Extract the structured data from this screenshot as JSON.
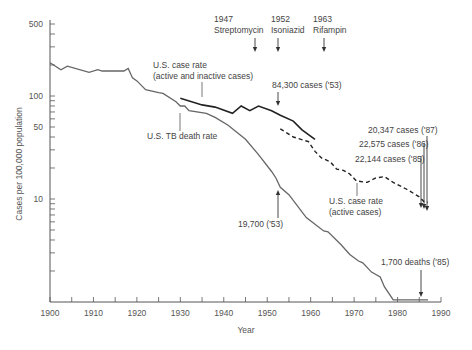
{
  "chart_data": {
    "type": "line",
    "title": "",
    "xlabel": "Year",
    "ylabel": "Cases per 100,000 population",
    "yscale": "log",
    "xlim": [
      1900,
      1990
    ],
    "ylim": [
      1,
      500
    ],
    "x_ticks": [
      "1900",
      "1910",
      "1920",
      "1930",
      "1940",
      "1950",
      "1960",
      "1970",
      "1980",
      "1990"
    ],
    "y_ticks": [
      "500",
      "100",
      "50",
      "10"
    ],
    "grid": false,
    "legend": "none (inline annotations)",
    "series": [
      {
        "name": "U.S. TB death rate",
        "style": "solid-gray",
        "x": [
          1900,
          1902.5,
          1904,
          1909,
          1911,
          1912,
          1917,
          1918,
          1919,
          1920,
          1922,
          1925,
          1926,
          1929,
          1930,
          1931,
          1932,
          1936,
          1938,
          1941,
          1945,
          1948,
          1951,
          1952,
          1953,
          1955,
          1959,
          1963,
          1964,
          1967,
          1969,
          1971,
          1972,
          1974,
          1976,
          1977,
          1979,
          1980,
          1985,
          1987
        ],
        "values": [
          210,
          180,
          195,
          170,
          180,
          175,
          175,
          185,
          150,
          140,
          115,
          108,
          106,
          88,
          80,
          80,
          72,
          68,
          62,
          52,
          38,
          27,
          18.5,
          16,
          13,
          11,
          6.6,
          4.9,
          4.8,
          3.6,
          2.9,
          2.5,
          2.4,
          1.95,
          1.75,
          1.4,
          1.05,
          1.05,
          1.05,
          1.05
        ]
      },
      {
        "name": "U.S. case rate (active and inactive cases)",
        "style": "solid-black",
        "x": [
          1930,
          1935,
          1938,
          1942,
          1944,
          1946,
          1948,
          1951,
          1953,
          1956,
          1958,
          1961
        ],
        "values": [
          95,
          82,
          78,
          68,
          80,
          72,
          80,
          72,
          65,
          57,
          47,
          38
        ]
      },
      {
        "name": "U.S. case rate (active cases)",
        "style": "dashed-black",
        "x": [
          1953,
          1956,
          1959.5,
          1961,
          1962.5,
          1964.5,
          1966,
          1967.5,
          1969,
          1970.5,
          1973,
          1975,
          1977,
          1979,
          1982,
          1985,
          1986,
          1987
        ],
        "values": [
          48,
          40,
          36,
          29,
          25,
          23,
          19.5,
          19,
          17.5,
          15,
          14.5,
          16,
          16.5,
          14.5,
          12.5,
          10.5,
          9.5,
          9.3
        ]
      }
    ],
    "annotations": [
      {
        "text": "1947",
        "text2": "Streptomycin",
        "x": 1947,
        "arrow": "down"
      },
      {
        "text": "1952",
        "text2": "Isoniazid",
        "x": 1952,
        "arrow": "down"
      },
      {
        "text": "1963",
        "text2": "Rifampin",
        "x": 1963,
        "arrow": "down"
      },
      {
        "text": "84,300 cases ('53)",
        "x": 1953,
        "arrow": "down"
      },
      {
        "text": "19,700 ('53)",
        "x": 1953,
        "arrow": "up"
      },
      {
        "text": "1,700 deaths ('85)",
        "x": 1985,
        "arrow": "down"
      },
      {
        "text": "22,144 cases ('85)",
        "x": 1985,
        "arrow": "down"
      },
      {
        "text": "22,575 cases ('86)",
        "x": 1986,
        "arrow": "down"
      },
      {
        "text": "20,347 cases ('87)",
        "x": 1987,
        "arrow": "down"
      }
    ],
    "series_labels": {
      "death_rate": "U.S. TB death rate",
      "case_total_line1": "U.S. case rate",
      "case_total_line2": "(active and inactive cases)",
      "case_active_line1": "U.S. case rate",
      "case_active_line2": "(active cases)"
    }
  }
}
